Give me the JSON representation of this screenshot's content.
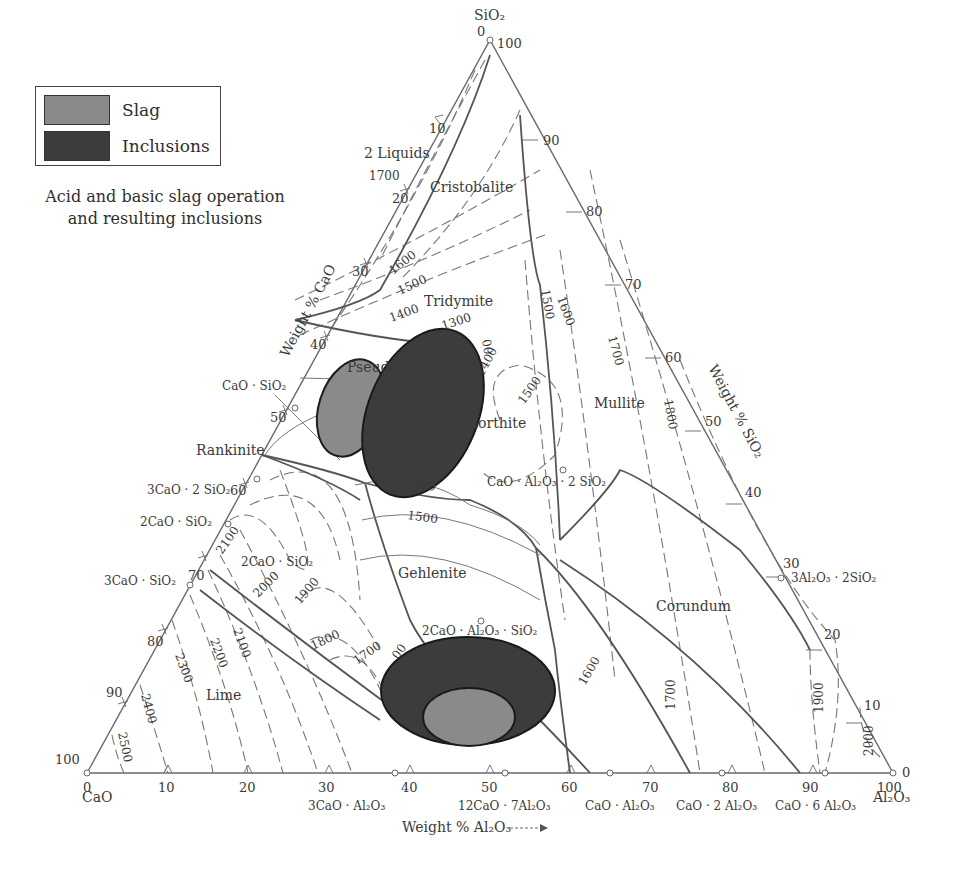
{
  "legend": {
    "items": [
      {
        "label": "Slag",
        "color": "#8a8a8a"
      },
      {
        "label": "Inclusions",
        "color": "#3c3c3c"
      }
    ]
  },
  "caption": {
    "line1": "Acid and basic slag operation",
    "line2": "and resulting inclusions"
  },
  "vertices": {
    "top": "SiO₂",
    "left": "CaO",
    "right": "Al₂O₃"
  },
  "axes": {
    "cao": {
      "label": "Weight % CaO",
      "ticks": [
        "0",
        "10",
        "20",
        "30",
        "40",
        "50",
        "60",
        "70",
        "80",
        "90",
        "100"
      ]
    },
    "sio2": {
      "label": "Weight % SiO₂",
      "ticks": [
        "100",
        "90",
        "80",
        "70",
        "60",
        "50",
        "40",
        "30",
        "20",
        "10",
        "0"
      ]
    },
    "al2o3": {
      "label": "Weight % Al₂O₃",
      "ticks": [
        "0",
        "10",
        "20",
        "30",
        "40",
        "50",
        "60",
        "70",
        "80",
        "90",
        "100"
      ]
    }
  },
  "compounds": {
    "cs": "CaO · SiO₂",
    "c3s2": "3CaO · 2 SiO₂",
    "c2s": "2CaO · SiO₂",
    "c3s": "3CaO · SiO₂",
    "c3a": "3CaO · Al₂O₃",
    "c12a7": "12CaO · 7Al₂O₃",
    "ca": "CaO · Al₂O₃",
    "ca2": "CaO · 2 Al₂O₃",
    "ca6": "CaO · 6 Al₂O₃",
    "cas2": "CaO · Al₂O₃ · 2 SiO₂",
    "c2as": "2CaO · Al₂O₃ · SiO₂",
    "a3s2": "3Al₂O₃ · 2SiO₂",
    "c2s_inner": "2CaO · SiO₂"
  },
  "phases": {
    "two_liquids": "2 Liquids",
    "cristobalite": "Cristobalite",
    "tridymite": "Tridymite",
    "pseudo": "Pseudo",
    "anorthite": "northite",
    "rankinite": "Rankinite",
    "mullite": "Mullite",
    "gehlenite": "Gehlenite",
    "corundum": "Corundum",
    "lime": "Lime"
  },
  "isotherms": [
    "1700",
    "1600",
    "1500",
    "1400",
    "1300",
    "00",
    "1400",
    "1500",
    "1600",
    "1700",
    "1800",
    "1500",
    "1400",
    "1500",
    "2100",
    "2000",
    "1900",
    "1800",
    "1700",
    "00",
    "2300",
    "2200",
    "2100",
    "2400",
    "2500",
    "1600",
    "1700",
    "1900",
    "2000",
    "1500"
  ],
  "colors": {
    "slag": "#8a8a8a",
    "inclusions": "#3c3c3c",
    "line": "#555555",
    "text": "#3a3a3a"
  }
}
